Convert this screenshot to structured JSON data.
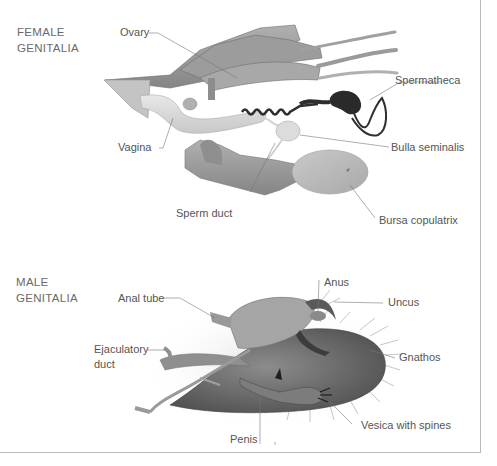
{
  "figure": {
    "sections": [
      {
        "id": "female",
        "title_line1": "FEMALE",
        "title_line2": "GENITALIA",
        "labels": [
          {
            "text": "Ovary"
          },
          {
            "text": "Spermatheca"
          },
          {
            "text": "Vagina"
          },
          {
            "text": "Bulla seminalis"
          },
          {
            "text": "Sperm duct"
          },
          {
            "text": "Bursa copulatrix"
          }
        ]
      },
      {
        "id": "male",
        "title_line1": "MALE",
        "title_line2": "GENITALIA",
        "labels": [
          {
            "text": "Anus"
          },
          {
            "text": "Anal tube"
          },
          {
            "text": "Uncus"
          },
          {
            "text": "Ejaculatory"
          },
          {
            "text": "duct"
          },
          {
            "text": "Gnathos"
          },
          {
            "text": "Vesica with spines"
          },
          {
            "text": "Penis"
          }
        ]
      }
    ],
    "colors": {
      "label_text": "#555555",
      "leader_line": "#777777",
      "tissue_mid": "#9a9a9a",
      "tissue_light": "#d6d6d6",
      "tissue_dark": "#3a3a3a",
      "frame": "#b9b9b9"
    }
  }
}
